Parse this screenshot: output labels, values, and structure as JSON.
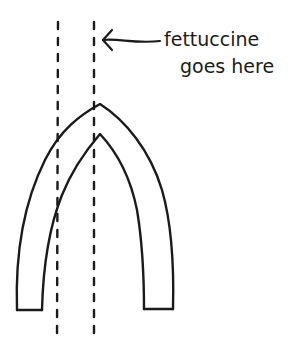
{
  "diagram": {
    "annotation": {
      "line1": "fettuccine",
      "line2": "goes here",
      "points_to": "right-dashed-guide"
    },
    "elements": {
      "arch": "pasta-arch (double-walled inverted U)",
      "guides": [
        "left-dashed-guide",
        "right-dashed-guide"
      ],
      "arrow": "annotation-arrow"
    },
    "colors": {
      "ink": "#1a1a1a",
      "background": "#ffffff"
    }
  }
}
